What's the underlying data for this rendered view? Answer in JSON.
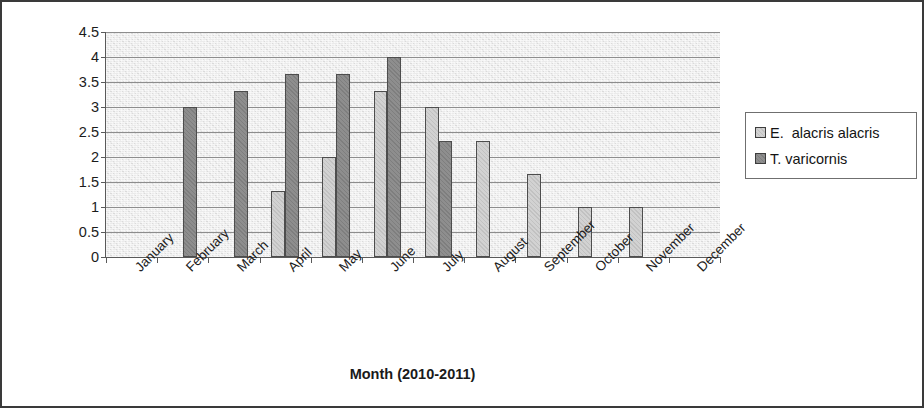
{
  "chart_data": {
    "type": "bar",
    "title": "",
    "xlabel": "Month (2010-2011)",
    "ylabel": "No. of individual/15m",
    "ylabel_superscript": "2",
    "ylim": [
      0,
      4.5
    ],
    "yticks": [
      "0",
      "0.5",
      "1",
      "1.5",
      "2",
      "2.5",
      "3",
      "3.5",
      "4",
      "4.5"
    ],
    "ytick_values": [
      0,
      0.5,
      1,
      1.5,
      2,
      2.5,
      3,
      3.5,
      4,
      4.5
    ],
    "grid": true,
    "legend_position": "right",
    "categories": [
      "January",
      "February",
      "March",
      "April",
      "May",
      "June",
      "July",
      "August",
      "September",
      "October",
      "November",
      "December"
    ],
    "series": [
      {
        "name": "E.  alacris alacris",
        "color": "#d2d2d2",
        "values": [
          0,
          0,
          0,
          1.33,
          2,
          3.33,
          3,
          2.33,
          1.67,
          1,
          1,
          0
        ]
      },
      {
        "name": "T. varicornis",
        "color": "#8e8e8e",
        "values": [
          0,
          3,
          3.33,
          3.67,
          3.67,
          4,
          2.33,
          0,
          0,
          0,
          0,
          0
        ]
      }
    ]
  },
  "legend": {
    "entries": [
      {
        "label": "E.  alacris alacris",
        "swatch": "series-light"
      },
      {
        "label": "T. varicornis",
        "swatch": "series-dark"
      }
    ]
  }
}
